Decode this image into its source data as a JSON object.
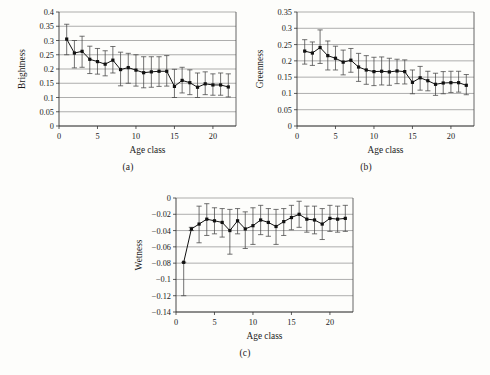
{
  "figure": {
    "panels": [
      {
        "caption": "(a)",
        "chart_data": {
          "type": "line",
          "title": "",
          "xlabel": "Age class",
          "ylabel": "Brightness",
          "xlim": [
            0,
            23
          ],
          "ylim": [
            0,
            0.4
          ],
          "xticks": [
            0,
            5,
            10,
            15,
            20
          ],
          "xtick_labels": [
            "0",
            "5",
            "10",
            "15",
            "20"
          ],
          "yticks": [
            0,
            0.05,
            0.1,
            0.15,
            0.2,
            0.25,
            0.3,
            0.35,
            0.4
          ],
          "ytick_labels": [
            "0",
            "0.05",
            "0.1",
            "0.15",
            "0.2",
            "0.25",
            "0.3",
            "0.35",
            "0.4"
          ],
          "grid": true,
          "legend": "none",
          "errorbars": true,
          "x": [
            1,
            2,
            3,
            4,
            5,
            6,
            7,
            8,
            9,
            10,
            11,
            12,
            13,
            14,
            15,
            16,
            17,
            18,
            19,
            20,
            21,
            22
          ],
          "values": [
            0.305,
            0.256,
            0.262,
            0.234,
            0.226,
            0.217,
            0.231,
            0.198,
            0.205,
            0.196,
            0.187,
            0.19,
            0.192,
            0.192,
            0.139,
            0.16,
            0.152,
            0.136,
            0.148,
            0.144,
            0.144,
            0.137
          ],
          "err_upper": [
            0.357,
            0.3,
            0.315,
            0.28,
            0.272,
            0.264,
            0.279,
            0.259,
            0.255,
            0.25,
            0.243,
            0.243,
            0.243,
            0.247,
            0.199,
            0.206,
            0.197,
            0.186,
            0.19,
            0.183,
            0.186,
            0.183
          ],
          "err_lower": [
            0.25,
            0.204,
            0.206,
            0.184,
            0.182,
            0.176,
            0.186,
            0.141,
            0.15,
            0.14,
            0.134,
            0.136,
            0.139,
            0.14,
            0.1,
            0.116,
            0.11,
            0.1,
            0.11,
            0.108,
            0.108,
            0.102
          ]
        }
      },
      {
        "caption": "(b)",
        "chart_data": {
          "type": "line",
          "title": "",
          "xlabel": "Age class",
          "ylabel": "Greenness",
          "xlim": [
            0,
            23
          ],
          "ylim": [
            0,
            0.35
          ],
          "xticks": [
            0,
            5,
            10,
            15,
            20
          ],
          "xtick_labels": [
            "0",
            "5",
            "10",
            "15",
            "20"
          ],
          "yticks": [
            0,
            0.05,
            0.1,
            0.15,
            0.2,
            0.25,
            0.3,
            0.35
          ],
          "ytick_labels": [
            "0",
            "0.05",
            "0.1",
            "0.15",
            "0.2",
            "0.25",
            "0.3",
            "0.35"
          ],
          "grid": true,
          "legend": "none",
          "errorbars": true,
          "x": [
            1,
            2,
            3,
            4,
            5,
            6,
            7,
            8,
            9,
            10,
            11,
            12,
            13,
            14,
            15,
            16,
            17,
            18,
            19,
            20,
            21,
            22
          ],
          "values": [
            0.23,
            0.224,
            0.241,
            0.216,
            0.208,
            0.196,
            0.202,
            0.181,
            0.172,
            0.167,
            0.168,
            0.166,
            0.169,
            0.167,
            0.134,
            0.148,
            0.139,
            0.128,
            0.132,
            0.133,
            0.133,
            0.125
          ],
          "err_upper": [
            0.265,
            0.258,
            0.295,
            0.261,
            0.245,
            0.233,
            0.238,
            0.223,
            0.216,
            0.211,
            0.212,
            0.208,
            0.205,
            0.203,
            0.172,
            0.183,
            0.168,
            0.162,
            0.167,
            0.168,
            0.168,
            0.158
          ],
          "err_lower": [
            0.19,
            0.186,
            0.192,
            0.172,
            0.172,
            0.157,
            0.165,
            0.137,
            0.128,
            0.124,
            0.126,
            0.125,
            0.13,
            0.129,
            0.099,
            0.11,
            0.108,
            0.094,
            0.099,
            0.103,
            0.104,
            0.096
          ]
        }
      },
      {
        "caption": "(c)",
        "chart_data": {
          "type": "line",
          "title": "",
          "xlabel": "Age class",
          "ylabel": "Wetness",
          "xlim": [
            0,
            23
          ],
          "ylim": [
            -0.14,
            0
          ],
          "xticks": [
            0,
            5,
            10,
            15,
            20
          ],
          "xtick_labels": [
            "0",
            "5",
            "10",
            "15",
            "20"
          ],
          "yticks": [
            -0.14,
            -0.12,
            -0.1,
            -0.08,
            -0.06,
            -0.04,
            -0.02,
            0
          ],
          "ytick_labels": [
            "−0.14",
            "−0.12",
            "−0.1",
            "−0.08",
            "−0.06",
            "−0.04",
            "−0.02",
            "0"
          ],
          "grid": true,
          "legend": "none",
          "errorbars": true,
          "x": [
            1,
            2,
            3,
            4,
            5,
            6,
            7,
            8,
            9,
            10,
            11,
            12,
            13,
            14,
            15,
            16,
            17,
            18,
            19,
            20,
            21,
            22
          ],
          "values": [
            -0.079,
            -0.038,
            -0.032,
            -0.026,
            -0.028,
            -0.03,
            -0.04,
            -0.028,
            -0.038,
            -0.034,
            -0.027,
            -0.03,
            -0.035,
            -0.029,
            -0.024,
            -0.02,
            -0.026,
            -0.027,
            -0.032,
            -0.025,
            -0.026,
            -0.025
          ],
          "err_upper": [
            -0.079,
            -0.036,
            -0.01,
            -0.007,
            -0.012,
            -0.013,
            -0.014,
            -0.013,
            -0.017,
            -0.012,
            -0.009,
            -0.013,
            -0.014,
            -0.013,
            -0.009,
            -0.004,
            -0.01,
            -0.01,
            -0.013,
            -0.009,
            -0.01,
            -0.009
          ],
          "err_lower": [
            -0.12,
            -0.04,
            -0.055,
            -0.046,
            -0.044,
            -0.048,
            -0.069,
            -0.044,
            -0.062,
            -0.057,
            -0.045,
            -0.047,
            -0.057,
            -0.046,
            -0.039,
            -0.036,
            -0.042,
            -0.044,
            -0.051,
            -0.041,
            -0.042,
            -0.041
          ]
        }
      }
    ]
  }
}
